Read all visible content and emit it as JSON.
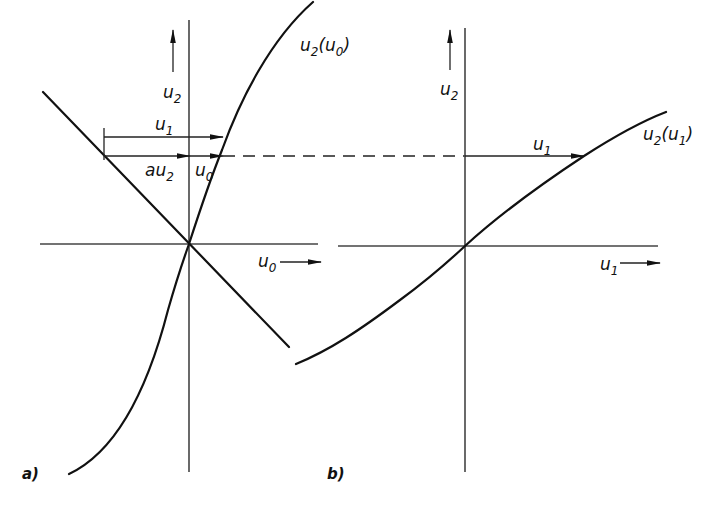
{
  "figure": {
    "panel_a": {
      "caption": "a)",
      "y_axis_label": {
        "main": "u",
        "sub": "2"
      },
      "x_axis_label": {
        "main": "u",
        "sub": "0"
      },
      "curve_label": {
        "main": "u",
        "sub": "2",
        "arg_main": "u",
        "arg_sub": "0"
      },
      "arrow_u1_label": {
        "main": "u",
        "sub": "1"
      },
      "arrow_au2_label": {
        "main": "au",
        "sub": "2"
      },
      "arrow_u0_label": {
        "main": "u",
        "sub": "0"
      }
    },
    "panel_b": {
      "caption": "b)",
      "y_axis_label": {
        "main": "u",
        "sub": "2"
      },
      "x_axis_label": {
        "main": "u",
        "sub": "1"
      },
      "curve_label": {
        "main": "u",
        "sub": "2",
        "arg_main": "u",
        "arg_sub": "1"
      },
      "arrow_u1_label": {
        "main": "u",
        "sub": "1"
      }
    },
    "colors": {
      "ink": "#111111",
      "axis": "#444444",
      "background": "#ffffff"
    }
  }
}
